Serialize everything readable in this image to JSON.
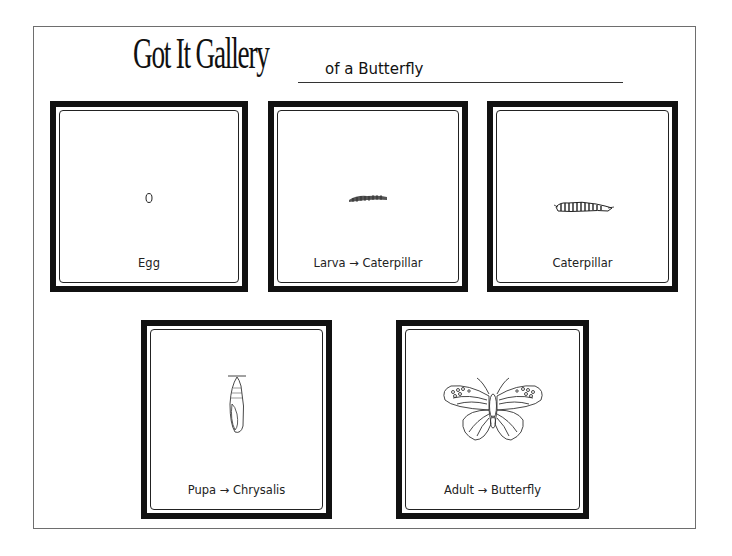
{
  "header": {
    "title": "Got It Gallery",
    "subtitle": "of a Butterfly"
  },
  "cards": [
    {
      "id": "egg",
      "label": "Egg",
      "illustration": "egg-icon"
    },
    {
      "id": "larva",
      "label": "Larva → Caterpillar",
      "illustration": "small-caterpillar-icon"
    },
    {
      "id": "caterpillar",
      "label": "Caterpillar",
      "illustration": "caterpillar-icon"
    },
    {
      "id": "pupa",
      "label": "Pupa → Chrysalis",
      "illustration": "chrysalis-icon"
    },
    {
      "id": "adult",
      "label": "Adult → Butterfly",
      "illustration": "butterfly-icon"
    }
  ],
  "colors": {
    "frame": "#111111",
    "page_border": "#6e6e6e",
    "background": "#ffffff"
  }
}
